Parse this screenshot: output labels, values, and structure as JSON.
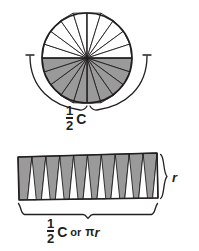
{
  "figure": {
    "colors": {
      "stroke": "#231f20",
      "shaded_sector_fill": "#9a9a9a",
      "unshaded_sector_fill": "#ffffff",
      "background": "#ffffff"
    },
    "circle": {
      "name": "sector-circle",
      "center_x": 87,
      "center_y": 58,
      "radius": 45,
      "sector_count": 20,
      "shaded_half": "bottom",
      "diameter_line": true
    },
    "circle_measure": {
      "name": "half-circumference-brace",
      "label_numerator": "1",
      "label_denominator": "2",
      "label_symbol": "C",
      "label_text": "1/2 C"
    },
    "rectangle": {
      "name": "rearranged-sectors-rectangle",
      "left": 18,
      "right": 158,
      "top": 155,
      "bottom": 200,
      "triangle_pairs": 10,
      "shaded_triangles": 10,
      "unshaded_triangles": 10
    },
    "rectangle_height_measure": {
      "name": "radius-brace",
      "label_symbol": "r",
      "label_text": "r"
    },
    "rectangle_width_measure": {
      "name": "half-circumference-or-pi-r-brace",
      "label_numerator": "1",
      "label_denominator": "2",
      "label_symbol": "C",
      "label_conjunction": "or",
      "label_pi": "π",
      "label_radius": "r",
      "label_text": "1/2 C or πr"
    }
  }
}
